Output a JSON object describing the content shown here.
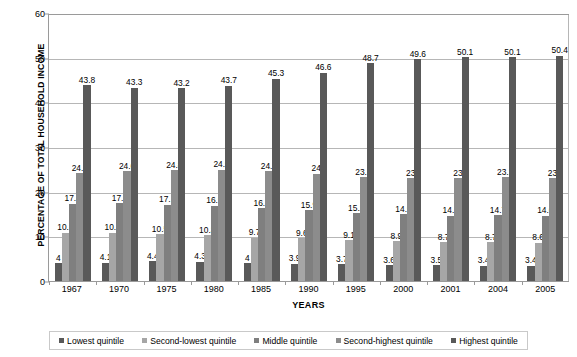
{
  "chart_data": {
    "type": "bar",
    "title": "",
    "xlabel": "YEARS",
    "ylabel": "PERCENTAGE OF TOTAL HOUSEHOLD INCOME",
    "categories": [
      "1967",
      "1970",
      "1975",
      "1980",
      "1985",
      "1990",
      "1995",
      "2000",
      "2001",
      "2004",
      "2005"
    ],
    "ylim": [
      0,
      60
    ],
    "yticks": [
      0,
      10,
      20,
      30,
      40,
      50,
      60
    ],
    "grid": true,
    "legend_position": "bottom",
    "data_labels": true,
    "series": [
      {
        "name": "Lowest quintile",
        "color": "#595959",
        "values": [
          4,
          4.1,
          4.4,
          4.3,
          4,
          3.9,
          3.7,
          3.6,
          3.5,
          3.4,
          3.4
        ],
        "labels": [
          "4",
          "4.1",
          "4.4",
          "4.3",
          "4",
          "3.9",
          "3.7",
          "3.6",
          "3.5",
          "3.4",
          "3.4"
        ]
      },
      {
        "name": "Second-lowest quintile",
        "color": "#a6a6a6",
        "values": [
          10.8,
          10.8,
          10.5,
          10.3,
          9.7,
          9.6,
          9.1,
          8.9,
          8.7,
          8.7,
          8.6
        ],
        "labels": [
          "10.8",
          "10.8",
          "10.5",
          "10.3",
          "9.7",
          "9.6",
          "9.1",
          "8.9",
          "8.7",
          "8.7",
          "8.6"
        ]
      },
      {
        "name": "Middle quintile",
        "color": "#7f7f7f",
        "values": [
          17.3,
          17.4,
          17.1,
          16.9,
          16.3,
          15.9,
          15.2,
          14.9,
          14.6,
          14.7,
          14.6
        ],
        "labels": [
          "17.3",
          "17.4",
          "17.1",
          "16.9",
          "16.3",
          "15.9",
          "15.2",
          "14.9",
          "14.6",
          "14.7",
          "14.6"
        ]
      },
      {
        "name": "Second-highest quintile",
        "color": "#8c8c8c",
        "values": [
          24.2,
          24.6,
          24.8,
          24.9,
          24.6,
          24,
          23.3,
          23,
          23,
          23.2,
          23
        ],
        "labels": [
          "24.2",
          "24.6",
          "24.8",
          "24.9",
          "24.6",
          "24",
          "23.3",
          "23",
          "23",
          "23.2",
          "23"
        ]
      },
      {
        "name": "Highest quintile",
        "color": "#595959",
        "values": [
          43.8,
          43.3,
          43.2,
          43.7,
          45.3,
          46.6,
          48.7,
          49.6,
          50.1,
          50.1,
          50.4
        ],
        "labels": [
          "43.8",
          "43.3",
          "43.2",
          "43.7",
          "45.3",
          "46.6",
          "48.7",
          "49.6",
          "50.1",
          "50.1",
          "50.4"
        ]
      }
    ]
  },
  "axis": {
    "y_title": "PERCENTAGE OF TOTAL HOUSEHOLD INCOME",
    "x_title": "YEARS",
    "y_tick_labels": [
      "60",
      "50",
      "40",
      "30",
      "20",
      "10",
      "0"
    ]
  },
  "legend": {
    "items": [
      {
        "label": "Lowest quintile",
        "color": "#595959"
      },
      {
        "label": "Second-lowest quintile",
        "color": "#a6a6a6"
      },
      {
        "label": "Middle quintile",
        "color": "#7f7f7f"
      },
      {
        "label": "Second-highest quintile",
        "color": "#8c8c8c"
      },
      {
        "label": "Highest quintile",
        "color": "#595959"
      }
    ]
  }
}
